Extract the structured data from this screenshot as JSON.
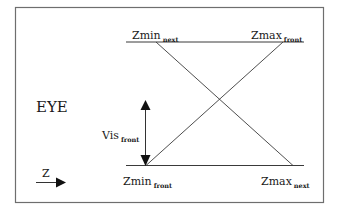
{
  "diagram": {
    "labels": {
      "zmin_next": {
        "main": "Zmin",
        "sub": "next"
      },
      "zmax_front": {
        "main": "Zmax",
        "sub": "front"
      },
      "zmin_front": {
        "main": "Zmin",
        "sub": "front"
      },
      "zmax_next": {
        "main": "Zmax",
        "sub": "next"
      },
      "vis_front": {
        "main": "Vis",
        "sub": "front"
      },
      "eye": "EYE",
      "z_axis": "Z"
    },
    "colors": {
      "line": "#3a3a3a",
      "frame": "#6e6e6e",
      "arrow": "#111111"
    }
  }
}
